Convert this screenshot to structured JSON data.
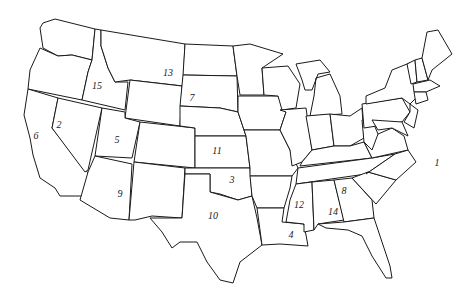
{
  "map": {
    "title": "",
    "type": "outline map of the contiguous United States with numbered states",
    "labels": [
      {
        "number": "1",
        "state": "North Carolina",
        "x": 437,
        "y": 163
      },
      {
        "number": "2",
        "state": "Nevada",
        "x": 59,
        "y": 125
      },
      {
        "number": "3",
        "state": "Oklahoma",
        "x": 232,
        "y": 180
      },
      {
        "number": "4",
        "state": "Louisiana",
        "x": 291,
        "y": 235
      },
      {
        "number": "5",
        "state": "Utah",
        "x": 117,
        "y": 140
      },
      {
        "number": "6",
        "state": "California",
        "x": 36,
        "y": 136
      },
      {
        "number": "7",
        "state": "South Dakota",
        "x": 192,
        "y": 98
      },
      {
        "number": "8",
        "state": "Georgia",
        "x": 344,
        "y": 191
      },
      {
        "number": "9",
        "state": "Arizona",
        "x": 120,
        "y": 194
      },
      {
        "number": "10",
        "state": "Texas",
        "x": 213,
        "y": 216
      },
      {
        "number": "11",
        "state": "Kansas",
        "x": 217,
        "y": 151
      },
      {
        "number": "12",
        "state": "Mississippi",
        "x": 299,
        "y": 205
      },
      {
        "number": "13",
        "state": "Montana",
        "x": 168,
        "y": 73
      },
      {
        "number": "14",
        "state": "Alabama",
        "x": 333,
        "y": 212
      },
      {
        "number": "15",
        "state": "Idaho",
        "x": 97,
        "y": 86
      }
    ],
    "colors": {
      "outline": "#1a1a1a",
      "fill": "#ffffff",
      "background": "#ffffff"
    }
  }
}
